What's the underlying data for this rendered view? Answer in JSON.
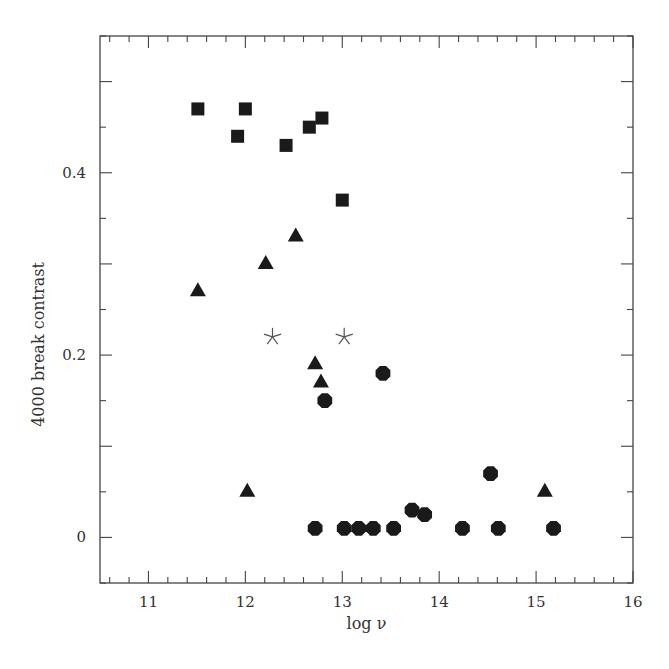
{
  "chart_data": {
    "type": "scatter",
    "title": "",
    "xlabel": "log ν",
    "ylabel": "4000 break contrast",
    "xlim": [
      10.5,
      16
    ],
    "ylim": [
      -0.05,
      0.55
    ],
    "x_ticks": [
      11,
      12,
      13,
      14,
      15,
      16
    ],
    "x_tick_labels": [
      "11",
      "12",
      "13",
      "14",
      "15",
      "16"
    ],
    "x_minor_step": 0.2,
    "y_ticks": [
      0,
      0.2,
      0.4
    ],
    "y_tick_labels": [
      "0",
      "0.2",
      "0.4"
    ],
    "y_minor_step": 0.05,
    "grid": false,
    "legend": null,
    "series": [
      {
        "name": "squares",
        "marker": "square",
        "color": "#1a1a1a",
        "points": [
          {
            "x": 11.51,
            "y": 0.47
          },
          {
            "x": 12.0,
            "y": 0.47
          },
          {
            "x": 11.92,
            "y": 0.44
          },
          {
            "x": 12.42,
            "y": 0.43
          },
          {
            "x": 12.66,
            "y": 0.45
          },
          {
            "x": 12.79,
            "y": 0.46
          },
          {
            "x": 13.0,
            "y": 0.37
          }
        ]
      },
      {
        "name": "triangles",
        "marker": "triangle",
        "color": "#1a1a1a",
        "points": [
          {
            "x": 11.51,
            "y": 0.27
          },
          {
            "x": 12.21,
            "y": 0.3
          },
          {
            "x": 12.52,
            "y": 0.33
          },
          {
            "x": 12.72,
            "y": 0.19
          },
          {
            "x": 12.78,
            "y": 0.17
          },
          {
            "x": 12.02,
            "y": 0.05
          },
          {
            "x": 15.09,
            "y": 0.05
          }
        ]
      },
      {
        "name": "stars",
        "marker": "star",
        "color": "#555555",
        "points": [
          {
            "x": 12.28,
            "y": 0.22
          },
          {
            "x": 13.02,
            "y": 0.22
          }
        ]
      },
      {
        "name": "circles",
        "marker": "circle",
        "color": "#1a1a1a",
        "points": [
          {
            "x": 12.82,
            "y": 0.15
          },
          {
            "x": 13.42,
            "y": 0.18
          },
          {
            "x": 12.72,
            "y": 0.01
          },
          {
            "x": 13.02,
            "y": 0.01
          },
          {
            "x": 13.17,
            "y": 0.01
          },
          {
            "x": 13.32,
            "y": 0.01
          },
          {
            "x": 13.53,
            "y": 0.01
          },
          {
            "x": 13.72,
            "y": 0.03
          },
          {
            "x": 13.85,
            "y": 0.025
          },
          {
            "x": 14.24,
            "y": 0.01
          },
          {
            "x": 14.53,
            "y": 0.07
          },
          {
            "x": 14.61,
            "y": 0.01
          },
          {
            "x": 15.18,
            "y": 0.01
          }
        ]
      }
    ]
  },
  "layout": {
    "plot_left": 100,
    "plot_right": 633,
    "plot_top": 36,
    "plot_bottom": 583
  }
}
